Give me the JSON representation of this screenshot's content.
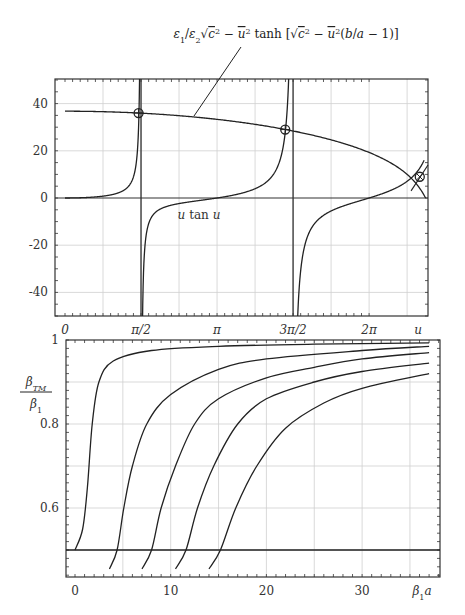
{
  "chart_data": [
    {
      "type": "line",
      "title": "",
      "xlabel": "u",
      "ylabel": "",
      "xlim": [
        -0.2,
        7.5
      ],
      "ylim": [
        -50,
        50
      ],
      "grid": true,
      "x_ticks": [
        {
          "value": 0,
          "label": "0"
        },
        {
          "value": 1.5708,
          "label": "π/2"
        },
        {
          "value": 3.1416,
          "label": "π"
        },
        {
          "value": 4.7124,
          "label": "3π/2"
        },
        {
          "value": 6.2832,
          "label": "2π"
        }
      ],
      "x_axis_name": "u",
      "y_ticks": [
        {
          "value": 40,
          "label": "40"
        },
        {
          "value": 20,
          "label": "20"
        },
        {
          "value": 0,
          "label": "0"
        },
        {
          "value": -20,
          "label": "-20"
        },
        {
          "value": -40,
          "label": "-40"
        }
      ],
      "series": [
        {
          "name": "u tan u",
          "function": "u*tan(u)",
          "label": "u tan u"
        },
        {
          "name": "tanh curve",
          "function": "eps1/eps2*sqrt(c^2-u^2)*tanh(sqrt(c^2-u^2)*(b/a-1))",
          "label": "ε₁/ε₂√(c² − u²) tanh[√(c² − u²)(b/a − 1)]",
          "x": [
            0,
            1,
            2,
            3,
            4,
            5,
            6,
            6.8,
            7.2,
            7.45
          ],
          "y": [
            36.8,
            36.2,
            34.5,
            32.5,
            30.0,
            26.0,
            19.5,
            12.5,
            7.0,
            0
          ]
        }
      ],
      "intersections": [
        {
          "u": 1.52,
          "y": 36.0,
          "marker": "circle-plus"
        },
        {
          "u": 4.55,
          "y": 29.0,
          "marker": "circle-plus"
        },
        {
          "u": 7.33,
          "y": 9.0,
          "marker": "circle-cross"
        }
      ],
      "asymptotes": [
        1.5708,
        4.7124
      ],
      "annotation": "ε₁/ε₂√(c² − u²) tanh[√(c² − u²)(b/a − 1)]"
    },
    {
      "type": "line",
      "title": "",
      "xlabel": "β₁a",
      "ylabel": "β_TM / β₁",
      "xlim": [
        -1,
        38
      ],
      "ylim": [
        0.44,
        1.0
      ],
      "grid": true,
      "x_ticks": [
        {
          "value": 0,
          "label": "0"
        },
        {
          "value": 10,
          "label": "10"
        },
        {
          "value": 20,
          "label": "20"
        },
        {
          "value": 30,
          "label": "30"
        }
      ],
      "x_axis_name": "β₁a",
      "y_ticks": [
        {
          "value": 1,
          "label": "1"
        },
        {
          "value": 0.8,
          "label": "0.8"
        },
        {
          "value": 0.6,
          "label": "0.6"
        }
      ],
      "horizontal_line": 0.5,
      "series": [
        {
          "name": "mode 0",
          "x": [
            0,
            0.8,
            1.3,
            1.8,
            2.5,
            4,
            8,
            15,
            25,
            37
          ],
          "y": [
            0.5,
            0.55,
            0.65,
            0.8,
            0.9,
            0.95,
            0.975,
            0.985,
            0.99,
            0.993
          ]
        },
        {
          "name": "mode 1",
          "x": [
            3.6,
            4.4,
            5.1,
            6,
            7.5,
            10,
            15,
            20,
            30,
            37
          ],
          "y": [
            0.455,
            0.5,
            0.6,
            0.7,
            0.8,
            0.87,
            0.93,
            0.955,
            0.975,
            0.985
          ]
        },
        {
          "name": "mode 2",
          "x": [
            7,
            8,
            9,
            10.5,
            12.5,
            15,
            20,
            25,
            30,
            37
          ],
          "y": [
            0.455,
            0.5,
            0.6,
            0.7,
            0.8,
            0.86,
            0.91,
            0.935,
            0.955,
            0.97
          ]
        },
        {
          "name": "mode 3",
          "x": [
            10.5,
            11.6,
            12.8,
            14.5,
            17,
            20,
            25,
            30,
            37
          ],
          "y": [
            0.455,
            0.5,
            0.6,
            0.7,
            0.8,
            0.86,
            0.9,
            0.925,
            0.945
          ]
        },
        {
          "name": "mode 4",
          "x": [
            14,
            15.2,
            16.8,
            19,
            22,
            26,
            30,
            37
          ],
          "y": [
            0.455,
            0.5,
            0.6,
            0.7,
            0.79,
            0.85,
            0.885,
            0.92
          ]
        }
      ]
    }
  ],
  "labels": {
    "top_formula": "ε₁/ε₂√c² − u² tanh [√c² − u²(b/a − 1)]",
    "curve_label": "u tan u",
    "top_x_axis": "u",
    "bottom_y_num": "β",
    "bottom_y_num_sub": "TM",
    "bottom_y_den": "β",
    "bottom_y_den_sub": "1",
    "bottom_x_axis": "β",
    "bottom_x_axis_sub": "1",
    "bottom_x_axis_tail": "a"
  }
}
